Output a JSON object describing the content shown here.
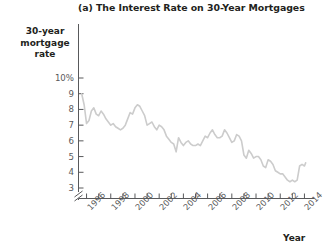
{
  "figure": {
    "title": "(a) The Interest Rate on 30-Year Mortgages",
    "ylabel_lines": [
      "30-year",
      "mortgage",
      "rate"
    ],
    "xlabel": "Year",
    "line_color": "#cccccc",
    "axis_color": "#58595b",
    "text_color": "#231f20",
    "background": "#ffffff"
  },
  "chart_data": {
    "type": "line",
    "title": "(a) The Interest Rate on 30-Year Mortgages",
    "xlabel": "Year",
    "ylabel": "30-year mortgage rate",
    "ylim": [
      3,
      10
    ],
    "xlim": [
      1995.5,
      2014.5
    ],
    "grid": false,
    "legend": null,
    "axis_break_y": true,
    "ytick_labels": [
      "10%",
      "9",
      "8",
      "7",
      "6",
      "5",
      "4",
      "3"
    ],
    "ytick_values": [
      10,
      9,
      8,
      7,
      6,
      5,
      4,
      3
    ],
    "xtick_values": [
      1996,
      1997,
      1998,
      1999,
      2000,
      2001,
      2002,
      2003,
      2004,
      2005,
      2006,
      2007,
      2008,
      2009,
      2010,
      2011,
      2012,
      2013,
      2014
    ],
    "xtick_labels": [
      "1996",
      "",
      "1998",
      "",
      "2000",
      "",
      "2002",
      "",
      "2004",
      "",
      "2006",
      "",
      "2008",
      "",
      "2010",
      "",
      "2012",
      "",
      "2014"
    ],
    "series": [
      {
        "name": "30-year mortgage rate",
        "x": [
          1995.6,
          1995.8,
          1996.0,
          1996.2,
          1996.4,
          1996.6,
          1996.8,
          1997.0,
          1997.2,
          1997.4,
          1997.6,
          1997.8,
          1998.0,
          1998.2,
          1998.4,
          1998.6,
          1998.8,
          1999.0,
          1999.2,
          1999.4,
          1999.6,
          1999.8,
          2000.0,
          2000.2,
          2000.4,
          2000.6,
          2000.8,
          2001.0,
          2001.2,
          2001.4,
          2001.6,
          2001.8,
          2002.0,
          2002.2,
          2002.4,
          2002.6,
          2002.8,
          2003.0,
          2003.2,
          2003.4,
          2003.6,
          2003.8,
          2004.0,
          2004.2,
          2004.4,
          2004.6,
          2004.8,
          2005.0,
          2005.2,
          2005.4,
          2005.6,
          2005.8,
          2006.0,
          2006.2,
          2006.4,
          2006.6,
          2006.8,
          2007.0,
          2007.2,
          2007.4,
          2007.6,
          2007.8,
          2008.0,
          2008.2,
          2008.4,
          2008.6,
          2008.8,
          2009.0,
          2009.2,
          2009.4,
          2009.6,
          2009.8,
          2010.0,
          2010.2,
          2010.4,
          2010.6,
          2010.8,
          2011.0,
          2011.2,
          2011.4,
          2011.6,
          2011.8,
          2012.0,
          2012.2,
          2012.4,
          2012.6,
          2012.8,
          2013.0,
          2013.2,
          2013.4,
          2013.6,
          2013.8,
          2014.0,
          2014.1
        ],
        "y": [
          9.0,
          8.3,
          7.1,
          7.3,
          7.9,
          8.1,
          7.7,
          7.6,
          7.9,
          7.7,
          7.4,
          7.2,
          7.0,
          7.1,
          6.9,
          6.8,
          6.7,
          6.8,
          7.0,
          7.4,
          7.8,
          7.7,
          8.1,
          8.3,
          8.2,
          7.9,
          7.6,
          7.0,
          7.1,
          7.2,
          6.9,
          6.7,
          7.0,
          6.9,
          6.7,
          6.3,
          6.1,
          5.9,
          5.8,
          5.3,
          6.2,
          5.9,
          5.7,
          5.9,
          6.0,
          5.8,
          5.7,
          5.7,
          5.8,
          5.7,
          6.0,
          6.3,
          6.2,
          6.5,
          6.7,
          6.4,
          6.2,
          6.2,
          6.3,
          6.7,
          6.5,
          6.2,
          5.9,
          6.0,
          6.4,
          6.3,
          6.0,
          5.1,
          4.9,
          5.4,
          5.2,
          4.9,
          5.0,
          5.0,
          4.8,
          4.4,
          4.3,
          4.8,
          4.7,
          4.5,
          4.1,
          4.0,
          3.9,
          3.9,
          3.7,
          3.5,
          3.4,
          3.5,
          3.4,
          3.5,
          4.4,
          4.5,
          4.4,
          4.6
        ]
      }
    ]
  }
}
